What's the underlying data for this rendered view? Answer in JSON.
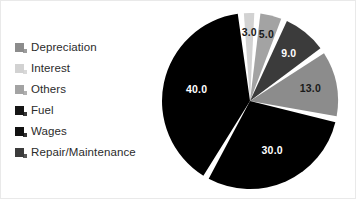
{
  "chart_data": {
    "type": "pie",
    "title": "",
    "categories": [
      "Interest",
      "Others",
      "Depreciation",
      "Repair/Maintenance",
      "Wages",
      "Fuel"
    ],
    "values": [
      3.0,
      5.0,
      9.0,
      13.0,
      30.0,
      40.0
    ],
    "value_labels": [
      "3.0",
      "5.0",
      "9.0",
      "13.0",
      "30.0",
      "40.0"
    ],
    "colors": [
      "#d2d2d2",
      "#a3a3a3",
      "#3b3b3b",
      "#8c8c8c",
      "#000000",
      "#000000"
    ],
    "label_colors": [
      "#1a1a1a",
      "#1a1a1a",
      "#ffffff",
      "#1a1a1a",
      "#ffffff",
      "#ffffff"
    ],
    "legend_position": "left",
    "grid": false,
    "wedge_gap": true,
    "wedge_gap_color": "#ffffff"
  },
  "legend": {
    "items": [
      {
        "label": "Depreciation",
        "color": "#8c8c8c",
        "value": "9.0"
      },
      {
        "label": "Interest",
        "color": "#d2d2d2",
        "value": "3.0"
      },
      {
        "label": "Others",
        "color": "#a3a3a3",
        "value": "5.0"
      },
      {
        "label": "Fuel",
        "color": "#151515",
        "value": "40.0"
      },
      {
        "label": "Wages",
        "color": "#111111",
        "value": "30.0"
      },
      {
        "label": "Repair/Maintenance",
        "color": "#3b3b3b",
        "value": "13.0"
      }
    ]
  },
  "pie": {
    "slices": [
      {
        "name": "interest",
        "label": "3.0",
        "color": "#d2d2d2",
        "label_color": "#1a1a1a"
      },
      {
        "name": "others",
        "label": "5.0",
        "color": "#a3a3a3",
        "label_color": "#1a1a1a"
      },
      {
        "name": "depreciation",
        "label": "9.0",
        "color": "#3b3b3b",
        "label_color": "#ffffff"
      },
      {
        "name": "fuel",
        "label": "40.0",
        "color": "#000000",
        "label_color": "#ffffff"
      },
      {
        "name": "wages",
        "label": "30.0",
        "color": "#000000",
        "label_color": "#ffffff"
      },
      {
        "name": "repair-maintenance",
        "label": "13.0",
        "color": "#8c8c8c",
        "label_color": "#1a1a1a"
      }
    ]
  }
}
